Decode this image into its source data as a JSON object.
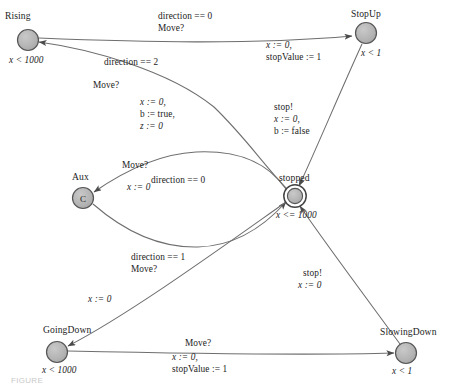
{
  "figure": {
    "type": "state-machine-diagram",
    "caption": "FIGURE"
  },
  "style": {
    "node_fill": "#b0b0b0",
    "node_stroke": "#4a4a4a",
    "edge_color": "#6d6d6d",
    "text_color": "#1c1c1c",
    "background": "#ffffff"
  },
  "nodes": [
    {
      "id": "rising",
      "name": "Rising",
      "invariant": "x < 1000",
      "inner_label": "",
      "shape": "circle",
      "cx": 28,
      "cy": 40,
      "r": 10.5,
      "name_x": 5,
      "name_y": 11,
      "inv_x": 10,
      "inv_y": 55
    },
    {
      "id": "stopup",
      "name": "StopUp",
      "invariant": "x < 1",
      "inner_label": "",
      "shape": "circle",
      "cx": 366,
      "cy": 33,
      "r": 10.5,
      "name_x": 352,
      "name_y": 8,
      "inv_x": 362,
      "inv_y": 49
    },
    {
      "id": "aux",
      "name": "Aux",
      "invariant": "",
      "inner_label": "C",
      "shape": "circle",
      "cx": 83,
      "cy": 198,
      "r": 10.5,
      "name_x": 73,
      "name_y": 171,
      "inv_x": 0,
      "inv_y": 0
    },
    {
      "id": "stopped",
      "name": "stopped",
      "invariant": "x <= 1000",
      "inner_label": "",
      "shape": "double-circle",
      "cx": 295,
      "cy": 196,
      "r": 10.5,
      "name_x": 280,
      "name_y": 172,
      "inv_x": 277,
      "inv_y": 211
    },
    {
      "id": "goingdown",
      "name": "GoingDown",
      "invariant": "x < 1000",
      "inner_label": "",
      "shape": "circle",
      "cx": 57,
      "cy": 352,
      "r": 10.5,
      "name_x": 44,
      "name_y": 325,
      "inv_x": 43,
      "inv_y": 366
    },
    {
      "id": "slowingdown",
      "name": "SlowingDown",
      "invariant": "x < 1",
      "inner_label": "",
      "shape": "circle",
      "cx": 406,
      "cy": 353,
      "r": 10.5,
      "name_x": 381,
      "name_y": 327,
      "inv_x": 393,
      "inv_y": 367
    }
  ],
  "edges": [
    {
      "id": "rising-to-stopup",
      "from": "rising",
      "to": "stopup",
      "guard": "direction == 0",
      "sync": "Move?",
      "assign": "x := 0,\nstopValue := 1"
    },
    {
      "id": "stopped-to-rising",
      "from": "stopped",
      "to": "rising",
      "guard": "direction == 2",
      "sync": "Move?",
      "assign": "x := 0,\nb := true,\nz := 0"
    },
    {
      "id": "stopup-to-stopped",
      "from": "stopup",
      "to": "stopped",
      "guard": "",
      "sync": "stop!",
      "assign": "x := 0,\nb := false"
    },
    {
      "id": "stopped-to-aux",
      "from": "stopped",
      "to": "aux",
      "guard": "direction == 0",
      "sync": "Move?",
      "assign": "x := 0"
    },
    {
      "id": "aux-to-stopped",
      "from": "aux",
      "to": "stopped",
      "guard": "",
      "sync": "",
      "assign": ""
    },
    {
      "id": "stopped-to-goingdown",
      "from": "stopped",
      "to": "goingdown",
      "guard": "direction == 1",
      "sync": "Move?",
      "assign": "x := 0"
    },
    {
      "id": "goingdown-to-slowingdown",
      "from": "goingdown",
      "to": "slowingdown",
      "guard": "",
      "sync": "Move?",
      "assign": "x := 0,\nstopValue := 1"
    },
    {
      "id": "slowingdown-to-stopped",
      "from": "slowingdown",
      "to": "stopped",
      "guard": "",
      "sync": "stop!",
      "assign": "x := 0"
    }
  ],
  "labels": {
    "l_dir0_move": {
      "line1": "direction == 0",
      "line2": "Move?"
    },
    "l_stopup_assign": {
      "line1": "x := 0,",
      "line2": "stopValue := 1"
    },
    "l_dir2": {
      "line1": "direction == 2"
    },
    "l_move2": {
      "line1": "Move?"
    },
    "l_rising_assign": {
      "line1": "x := 0,",
      "line2": "b := true,",
      "line3": "z := 0"
    },
    "l_stop_false": {
      "line1": "stop!",
      "line2": "x := 0,",
      "line3": "b := false"
    },
    "l_aux_move": {
      "line1": "Move?"
    },
    "l_aux_dir0": {
      "line1": "direction == 0"
    },
    "l_aux_assign": {
      "line1": "x := 0"
    },
    "l_dir1": {
      "line1": "direction == 1",
      "line2": "Move?"
    },
    "l_gd_assign": {
      "line1": "x := 0"
    },
    "l_bottom_move": {
      "line1": "Move?",
      "line2": "x := 0,",
      "line3": "stopValue := 1"
    },
    "l_stop_sd": {
      "line1": "stop!",
      "line2": "x := 0"
    }
  }
}
